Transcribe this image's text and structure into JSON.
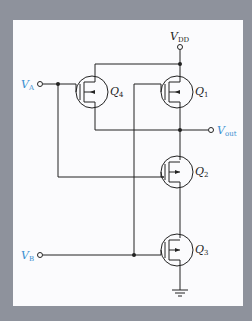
{
  "diagram": {
    "type": "CMOS logic gate schematic",
    "nodes": {
      "vdd": {
        "label": "V",
        "sub": "DD"
      },
      "va": {
        "label": "V",
        "sub": "A"
      },
      "vb": {
        "label": "V",
        "sub": "B"
      },
      "vout": {
        "label": "V",
        "sub": "out"
      }
    },
    "transistors": [
      {
        "id": "Q4",
        "label": "Q",
        "sub": "4",
        "type": "PMOS"
      },
      {
        "id": "Q1",
        "label": "Q",
        "sub": "1",
        "type": "PMOS"
      },
      {
        "id": "Q2",
        "label": "Q",
        "sub": "2",
        "type": "NMOS"
      },
      {
        "id": "Q3",
        "label": "Q",
        "sub": "3",
        "type": "NMOS"
      }
    ],
    "colors": {
      "background": "#8e929c",
      "panel": "#fbfbfd",
      "wire": "#222222",
      "input_label": "#3a8fd0"
    }
  }
}
